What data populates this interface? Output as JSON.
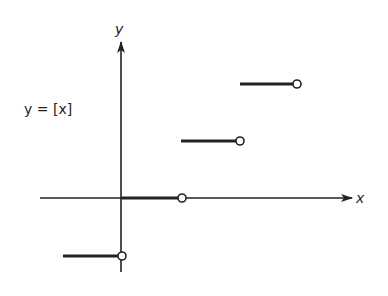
{
  "figure": {
    "equation_label": "y = [x]",
    "x_axis_label": "x",
    "y_axis_label": "y",
    "function": "greatest integer (floor) function",
    "colors": {
      "ink": "#222222",
      "background": "#ffffff"
    }
  },
  "segments": [
    {
      "y": -1,
      "x_start": -1,
      "x_end": 0,
      "closed_left": true,
      "open_right": true
    },
    {
      "y": 0,
      "x_start": 0,
      "x_end": 1,
      "closed_left": true,
      "open_right": true
    },
    {
      "y": 1,
      "x_start": 1,
      "x_end": 2,
      "closed_left": true,
      "open_right": true
    },
    {
      "y": 2,
      "x_start": 2,
      "x_end": 3,
      "closed_left": true,
      "open_right": true
    }
  ]
}
